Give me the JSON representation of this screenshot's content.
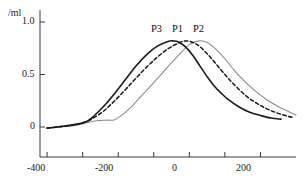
{
  "chart_data": {
    "type": "line",
    "title": "",
    "subtitle": "",
    "xlabel": "",
    "ylabel": "/ml",
    "xlim": [
      -420,
      300
    ],
    "ylim": [
      -0.08,
      1.05
    ],
    "grid": false,
    "legend_position": "inline-above-peaks",
    "x_ticks": [
      -400,
      -300,
      -200,
      -100,
      0,
      100,
      200
    ],
    "x_tick_labels": [
      "-400",
      "",
      "-200",
      "",
      "0",
      "",
      "200"
    ],
    "y_ticks": [
      0,
      0.5,
      1.0
    ],
    "y_tick_labels": [
      "0",
      "0.5",
      "1.0"
    ],
    "annotations": [
      {
        "text": "P3",
        "x": -55,
        "y": 0.95
      },
      {
        "text": "P1",
        "x": -5,
        "y": 0.95
      },
      {
        "text": "P2",
        "x": 48,
        "y": 0.95
      }
    ],
    "series": [
      {
        "name": "P3",
        "style": "solid",
        "color": "#1a1a1a",
        "width": 1.6,
        "peak_x": -45,
        "peak_y": 0.82,
        "x": [
          -400,
          -360,
          -320,
          -290,
          -270,
          -240,
          -210,
          -180,
          -150,
          -120,
          -90,
          -60,
          -45,
          -30,
          -10,
          10,
          30,
          50,
          70,
          90,
          110,
          140,
          170,
          200,
          230,
          258
        ],
        "y": [
          -0.01,
          0.005,
          0.025,
          0.05,
          0.1,
          0.2,
          0.32,
          0.45,
          0.58,
          0.69,
          0.77,
          0.815,
          0.82,
          0.81,
          0.76,
          0.68,
          0.58,
          0.48,
          0.39,
          0.32,
          0.26,
          0.19,
          0.14,
          0.11,
          0.085,
          0.075
        ]
      },
      {
        "name": "P1",
        "style": "dashed",
        "color": "#1a1a1a",
        "width": 1.5,
        "peak_x": -10,
        "peak_y": 0.82,
        "x": [
          -400,
          -360,
          -320,
          -290,
          -270,
          -240,
          -210,
          -180,
          -150,
          -120,
          -90,
          -60,
          -30,
          -10,
          10,
          30,
          55,
          80,
          105,
          130,
          160,
          190,
          220,
          250,
          280,
          295
        ],
        "y": [
          -0.01,
          0.005,
          0.025,
          0.05,
          0.085,
          0.155,
          0.25,
          0.355,
          0.465,
          0.57,
          0.665,
          0.745,
          0.8,
          0.82,
          0.805,
          0.765,
          0.68,
          0.58,
          0.48,
          0.39,
          0.295,
          0.225,
          0.17,
          0.13,
          0.1,
          0.09
        ]
      },
      {
        "name": "P2",
        "style": "solid",
        "color": "#8c8c8c",
        "width": 1.1,
        "peak_x": 28,
        "peak_y": 0.82,
        "x": [
          -400,
          -360,
          -320,
          -290,
          -260,
          -230,
          -210,
          -180,
          -150,
          -120,
          -90,
          -60,
          -30,
          0,
          28,
          50,
          75,
          100,
          130,
          160,
          190,
          220,
          250,
          280,
          300
        ],
        "y": [
          -0.01,
          0.0,
          0.015,
          0.04,
          0.06,
          0.065,
          0.07,
          0.14,
          0.24,
          0.35,
          0.46,
          0.575,
          0.685,
          0.785,
          0.82,
          0.805,
          0.74,
          0.65,
          0.525,
          0.42,
          0.33,
          0.255,
          0.195,
          0.145,
          0.115
        ]
      }
    ]
  },
  "axis": {
    "y_unit_label": "/ml",
    "y_tick_top": "1.0",
    "y_tick_mid": "0.5",
    "y_tick_zero": "0",
    "x_tick_neg400": "-400",
    "x_tick_neg200": "-200",
    "x_tick_zero": "0",
    "x_tick_200": "200"
  },
  "labels": {
    "p3": "P3",
    "p1": "P1",
    "p2": "P2"
  }
}
